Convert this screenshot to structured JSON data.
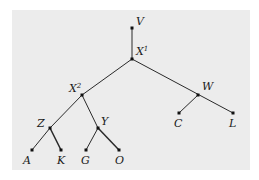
{
  "diagram": {
    "type": "tree",
    "background": "#ececec",
    "nodes": [
      {
        "id": "V",
        "label": "V",
        "sup": "",
        "x": 132,
        "y": 28
      },
      {
        "id": "X1",
        "label": "X",
        "sup": "1",
        "x": 132,
        "y": 59
      },
      {
        "id": "X2",
        "label": "X",
        "sup": "2",
        "x": 82,
        "y": 95
      },
      {
        "id": "W",
        "label": "W",
        "sup": "",
        "x": 198,
        "y": 95
      },
      {
        "id": "Z",
        "label": "Z",
        "sup": "",
        "x": 50,
        "y": 128
      },
      {
        "id": "Y",
        "label": "Y",
        "sup": "",
        "x": 98,
        "y": 128
      },
      {
        "id": "C",
        "label": "C",
        "sup": "",
        "x": 179,
        "y": 113
      },
      {
        "id": "L",
        "label": "L",
        "sup": "",
        "x": 233,
        "y": 113
      },
      {
        "id": "A",
        "label": "A",
        "sup": "",
        "x": 32,
        "y": 150
      },
      {
        "id": "K",
        "label": "K",
        "sup": "",
        "x": 61,
        "y": 150
      },
      {
        "id": "G",
        "label": "G",
        "sup": "",
        "x": 86,
        "y": 150
      },
      {
        "id": "O",
        "label": "O",
        "sup": "",
        "x": 119,
        "y": 150
      }
    ],
    "edges": [
      [
        "V",
        "X1"
      ],
      [
        "X1",
        "X2"
      ],
      [
        "X1",
        "W"
      ],
      [
        "X2",
        "Z"
      ],
      [
        "X2",
        "Y"
      ],
      [
        "W",
        "C"
      ],
      [
        "W",
        "L"
      ],
      [
        "Z",
        "A"
      ],
      [
        "Z",
        "K"
      ],
      [
        "Y",
        "G"
      ],
      [
        "Y",
        "O"
      ]
    ]
  }
}
